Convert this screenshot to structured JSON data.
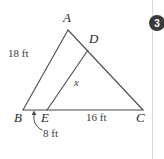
{
  "figure": {
    "kind": "geometry-triangle-diagram",
    "vertices": {
      "A": "A",
      "B": "B",
      "C": "C",
      "D": "D",
      "E": "E"
    },
    "measures": {
      "side_ab": "18 ft",
      "side_ec": "16 ft",
      "segment_be": "8 ft",
      "unknown_de": "x"
    },
    "geometry": {
      "A": [
        68,
        30
      ],
      "B": [
        23,
        110
      ],
      "C": [
        143,
        110
      ],
      "D": [
        88,
        50
      ],
      "E": [
        47,
        110
      ],
      "stroke": "#4a4a4a",
      "stroke_width": 1.1
    },
    "label_positions": {
      "A": [
        63,
        13
      ],
      "B": [
        15,
        112
      ],
      "C": [
        137,
        112
      ],
      "D": [
        89,
        33
      ],
      "E": [
        42,
        112
      ],
      "side_ab": [
        8,
        50
      ],
      "side_ec": [
        88,
        112
      ],
      "segment_be": [
        44,
        130
      ],
      "unknown_de": [
        74,
        78
      ]
    },
    "annotation_arrow": {
      "name": "eight-ft-leader-arrow",
      "path": "M 42 130 C 36 127 33 122 34 114",
      "arrow_tip": [
        34,
        111
      ]
    }
  },
  "page_rule": {
    "name": "page-margin-rule",
    "x": 152,
    "color": "#d8d8d8"
  },
  "badge": {
    "label": "3",
    "x": 149,
    "y": 15,
    "size": 16,
    "color": "#3a3a3a"
  }
}
